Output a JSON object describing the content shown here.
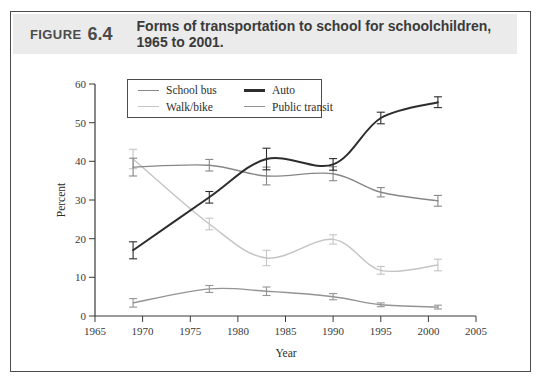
{
  "header": {
    "figure_word": "FIGURE",
    "figure_number": "6.4",
    "title": "Forms of transportation to school for schoolchildren, 1965 to 2001."
  },
  "chart_data": {
    "type": "line",
    "title": "Forms of transportation to school for schoolchildren, 1965 to 2001.",
    "x": [
      1969,
      1977,
      1983,
      1990,
      1995,
      2001
    ],
    "series": [
      {
        "name": "School bus",
        "color": "#878787",
        "values": [
          38.5,
          39.0,
          36.2,
          36.8,
          32.0,
          29.8
        ],
        "errors": [
          2.3,
          1.5,
          2.3,
          1.8,
          1.2,
          1.4
        ]
      },
      {
        "name": "Auto",
        "color": "#2d2d2d",
        "values": [
          17.0,
          30.7,
          40.6,
          39.2,
          51.2,
          55.3
        ],
        "errors": [
          2.2,
          1.5,
          2.8,
          1.5,
          1.5,
          1.4
        ]
      },
      {
        "name": "Walk/bike",
        "color": "#c4c4c4",
        "values": [
          40.6,
          23.8,
          15.0,
          19.8,
          11.8,
          13.2
        ],
        "errors": [
          2.5,
          1.5,
          2.0,
          1.2,
          1.0,
          1.5
        ]
      },
      {
        "name": "Public transit",
        "color": "#949494",
        "values": [
          3.4,
          7.0,
          6.4,
          5.0,
          2.9,
          2.3
        ],
        "errors": [
          1.1,
          0.9,
          1.1,
          0.8,
          0.5,
          0.5
        ]
      }
    ],
    "xlabel": "Year",
    "ylabel": "Percent",
    "xlim": [
      1965,
      2005
    ],
    "ylim": [
      0,
      60
    ],
    "xticks": [
      1965,
      1970,
      1975,
      1980,
      1985,
      1990,
      1995,
      2000,
      2005
    ],
    "yticks": [
      0,
      10,
      20,
      30,
      40,
      50,
      60
    ],
    "grid": false,
    "error_bars": true,
    "line_style": "smooth",
    "legend_position": "top-left-inside",
    "draw_order": [
      2,
      3,
      0,
      1
    ]
  }
}
